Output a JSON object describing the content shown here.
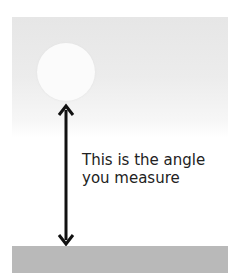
{
  "diagram": {
    "label_line1": "This is the angle",
    "label_line2": "you measure",
    "elements": [
      "sky-gradient",
      "sun-circle",
      "double-arrow",
      "ground-bar"
    ],
    "colors": {
      "sky": "#e6e6e6",
      "sun": "#fbfbfb",
      "arrow": "#111111",
      "ground": "#b9b9b9"
    }
  }
}
